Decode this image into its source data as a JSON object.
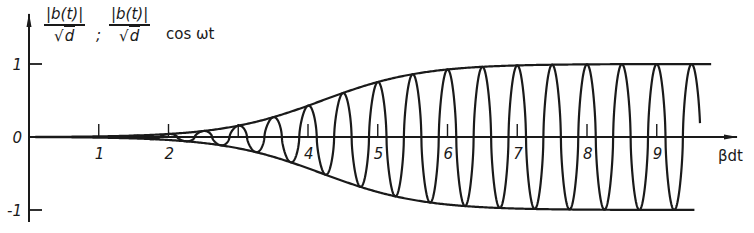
{
  "chart_data": {
    "type": "line",
    "ylabel": {
      "fraction_numerator": "|b(t)|",
      "fraction_denominator_radicand": "d",
      "separator": ";",
      "suffix": "cos ωt"
    },
    "xlabel": "βdt",
    "xlim": [
      0,
      10
    ],
    "ylim": [
      -1,
      1
    ],
    "x_ticks": [
      1,
      2,
      3,
      4,
      5,
      6,
      7,
      8,
      9
    ],
    "x_tick_labels": [
      "1",
      "2",
      "",
      "4",
      "5",
      "6",
      "7",
      "8",
      "9"
    ],
    "y_ticks": [
      1,
      0,
      -1
    ],
    "y_tick_labels": [
      "1",
      "0",
      "-1"
    ],
    "grid": false,
    "legend": null,
    "series": [
      {
        "name": "upper envelope |b(t)|/√d",
        "style": "solid",
        "model": "logistic",
        "x_end": 9.78,
        "x": [
          0,
          1,
          2,
          3,
          4,
          5,
          6,
          7,
          8,
          9,
          9.78
        ],
        "values": [
          0.0,
          0.01,
          0.05,
          0.19,
          0.42,
          0.76,
          0.92,
          0.98,
          0.99,
          1.0,
          1.0
        ]
      },
      {
        "name": "lower envelope -|b(t)|/√d",
        "style": "solid",
        "model": "logistic",
        "x_end": 9.55,
        "x": [
          0,
          1,
          2,
          3,
          4,
          5,
          6,
          7,
          8,
          9,
          9.55
        ],
        "values": [
          0.0,
          -0.01,
          -0.05,
          -0.19,
          -0.42,
          -0.76,
          -0.92,
          -0.98,
          -0.99,
          -1.0,
          -1.0
        ]
      },
      {
        "name": "oscillation |b(t)|/√d cos ωt",
        "style": "solid",
        "cycles_per_unit": 2,
        "x_start": 1.5,
        "x_end": 9.62,
        "peak_x": [
          2.0,
          2.5,
          3.0,
          3.5,
          4.0,
          4.5,
          5.0,
          5.5,
          6.0,
          6.5,
          7.0,
          7.5,
          8.0,
          8.5,
          9.0,
          9.5
        ],
        "peak_values": [
          0.05,
          0.1,
          0.19,
          0.3,
          0.42,
          0.6,
          0.76,
          0.86,
          0.92,
          0.96,
          0.98,
          0.99,
          0.99,
          1.0,
          1.0,
          1.0
        ]
      }
    ],
    "envelope_params": {
      "k": 1.4,
      "x0": 4.2
    }
  },
  "colors": {
    "ink": "#1a1a1a",
    "background": "#ffffff"
  }
}
